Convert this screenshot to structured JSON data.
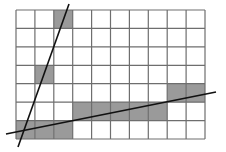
{
  "diagram": {
    "type": "grid-with-lines",
    "grid": {
      "columns": 10,
      "rows": 7,
      "left": 16,
      "top": 10,
      "right": 205,
      "bottom": 139,
      "line_color": "#6e6e6e",
      "background": "#ffffff"
    },
    "shade_color": "#9a9a9a",
    "shaded_cells": [
      {
        "col": 2,
        "row": 0
      },
      {
        "col": 1,
        "row": 3
      },
      {
        "col": 0,
        "row": 6
      },
      {
        "col": 1,
        "row": 6
      },
      {
        "col": 2,
        "row": 6
      },
      {
        "col": 3,
        "row": 5
      },
      {
        "col": 4,
        "row": 5
      },
      {
        "col": 5,
        "row": 5
      },
      {
        "col": 6,
        "row": 5
      },
      {
        "col": 7,
        "row": 5
      },
      {
        "col": 8,
        "row": 4
      },
      {
        "col": 9,
        "row": 4
      }
    ],
    "lines": [
      {
        "name": "steep-line",
        "x1": 69,
        "y1": 4,
        "x2": 18,
        "y2": 147,
        "color": "#111111"
      },
      {
        "name": "shallow-line",
        "x1": 6,
        "y1": 134,
        "x2": 216,
        "y2": 92,
        "color": "#111111"
      }
    ]
  }
}
